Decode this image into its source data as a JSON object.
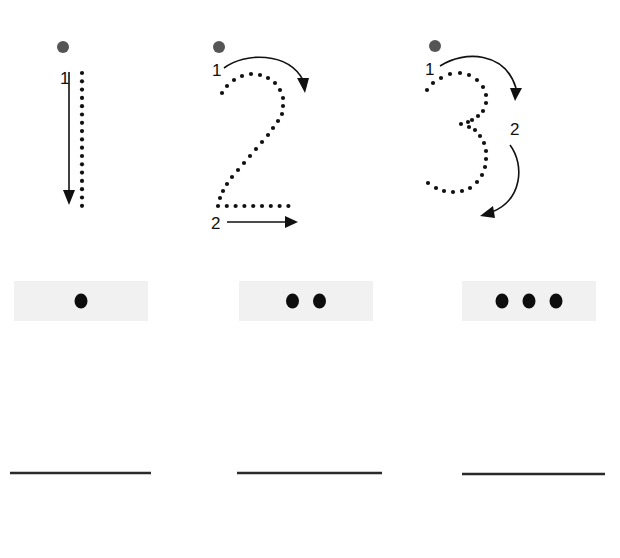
{
  "worksheet": {
    "title": "Number tracing worksheet",
    "numbers": [
      {
        "digit": "1",
        "count": 1,
        "strokes": [
          {
            "label": "1",
            "direction": "down"
          }
        ]
      },
      {
        "digit": "2",
        "count": 2,
        "strokes": [
          {
            "label": "1",
            "direction": "curve-right"
          },
          {
            "label": "2",
            "direction": "right"
          }
        ]
      },
      {
        "digit": "3",
        "count": 3,
        "strokes": [
          {
            "label": "1",
            "direction": "curve-right"
          },
          {
            "label": "2",
            "direction": "curve-left"
          }
        ]
      }
    ],
    "colors": {
      "start_dot": "#555555",
      "trace_dot": "#111111",
      "count_box": "#f1f1f1",
      "write_line": "#2a2a2a"
    }
  }
}
